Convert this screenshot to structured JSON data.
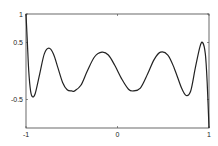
{
  "chart_data": {
    "type": "line",
    "title": "",
    "xlabel": "",
    "ylabel": "",
    "xlim": [
      -1,
      1
    ],
    "ylim": [
      -1,
      1
    ],
    "grid": false,
    "x_ticks": [
      {
        "value": -1,
        "label": "-1"
      },
      {
        "value": 0,
        "label": "0"
      },
      {
        "value": 1,
        "label": "1"
      }
    ],
    "y_ticks": [
      {
        "value": 1,
        "label": "1"
      },
      {
        "value": 0.5,
        "label": "0.5"
      },
      {
        "value": -0.5,
        "label": "-0.5"
      }
    ],
    "series": [
      {
        "name": "curve",
        "color": "#222222",
        "x": [
          -1,
          -0.985,
          -0.97,
          -0.95,
          -0.93,
          -0.9,
          -0.85,
          -0.8,
          -0.75,
          -0.7,
          -0.65,
          -0.6,
          -0.55,
          -0.5,
          -0.47,
          -0.4,
          -0.33,
          -0.25,
          -0.17,
          -0.1,
          -0.03,
          0.05,
          0.12,
          0.17,
          0.25,
          0.33,
          0.4,
          0.47,
          0.55,
          0.62,
          0.7,
          0.75,
          0.8,
          0.85,
          0.9,
          0.93,
          0.96,
          0.98,
          1
        ],
        "y": [
          1,
          0.5,
          0.0,
          -0.35,
          -0.45,
          -0.4,
          -0.05,
          0.3,
          0.4,
          0.3,
          0.05,
          -0.2,
          -0.33,
          -0.35,
          -0.35,
          -0.25,
          0.0,
          0.25,
          0.33,
          0.28,
          0.1,
          -0.15,
          -0.32,
          -0.35,
          -0.3,
          -0.05,
          0.2,
          0.33,
          0.28,
          0.05,
          -0.3,
          -0.43,
          -0.35,
          0.05,
          0.42,
          0.5,
          0.3,
          -0.2,
          -1
        ]
      }
    ]
  }
}
